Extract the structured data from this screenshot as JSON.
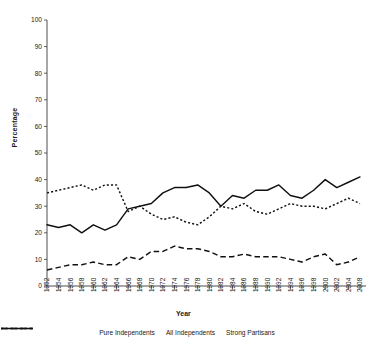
{
  "chart_data": {
    "type": "line",
    "title": "",
    "xlabel": "Year",
    "ylabel": "Percentage",
    "ylim": [
      0,
      100
    ],
    "yticks": [
      0,
      10,
      20,
      30,
      40,
      50,
      60,
      70,
      80,
      90,
      100
    ],
    "grid": false,
    "legend_position": "bottom",
    "categories": [
      "1952",
      "1954",
      "1956",
      "1958",
      "1960",
      "1962",
      "1964",
      "1966",
      "1968",
      "1970",
      "1972",
      "1974",
      "1976",
      "1978",
      "1980",
      "1982",
      "1984",
      "1986",
      "1988",
      "1990",
      "1992",
      "1994",
      "1996",
      "1998",
      "2000",
      "2002",
      "2004",
      "2008"
    ],
    "series": [
      {
        "name": "Pure Independents",
        "style": "dashed",
        "values": [
          6,
          7,
          8,
          8,
          9,
          8,
          8,
          11,
          10,
          13,
          13,
          15,
          14,
          14,
          13,
          11,
          11,
          12,
          11,
          11,
          11,
          10,
          9,
          11,
          12,
          8,
          9,
          11
        ]
      },
      {
        "name": "All Independents",
        "style": "solid",
        "values": [
          23,
          22,
          23,
          20,
          23,
          21,
          23,
          29,
          30,
          31,
          35,
          37,
          37,
          38,
          35,
          30,
          34,
          33,
          36,
          36,
          38,
          34,
          33,
          36,
          40,
          37,
          39,
          41
        ]
      },
      {
        "name": "Strong Partisans",
        "style": "dotted",
        "values": [
          35,
          36,
          37,
          38,
          36,
          38,
          38,
          28,
          30,
          27,
          25,
          26,
          24,
          23,
          26,
          30,
          29,
          31,
          28,
          27,
          29,
          31,
          30,
          30,
          29,
          31,
          33,
          31
        ]
      }
    ]
  },
  "legend": {
    "items": [
      {
        "label": "Pure Independents",
        "key": "dashed-line-key"
      },
      {
        "label": "All Independents",
        "key": "solid-line-key"
      },
      {
        "label": "Strong Partisans",
        "key": "dotted-line-key"
      }
    ]
  }
}
